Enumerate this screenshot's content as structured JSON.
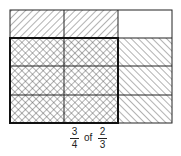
{
  "diagram": {
    "grid": {
      "columns": 3,
      "rows": 4
    },
    "shading": {
      "diagonal_right": "left 2 of 3 columns (2/3)",
      "diagonal_left": "bottom 3 of 4 rows (3/4)",
      "crosshatch": "overlap region (3/4 of 2/3)"
    },
    "colors": {
      "line": "#222222",
      "hatch": "#555555",
      "background": "#ffffff"
    }
  },
  "caption": {
    "fraction1": {
      "numerator": "3",
      "denominator": "4"
    },
    "connector": "of",
    "fraction2": {
      "numerator": "2",
      "denominator": "3"
    }
  }
}
